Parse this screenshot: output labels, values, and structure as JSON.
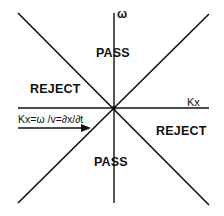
{
  "diagram": {
    "colors": {
      "line": "#111111",
      "background": "#ffffff"
    },
    "axes": {
      "vertical_label": "ω",
      "horizontal_label": "Kx"
    },
    "regions": {
      "top": "PASS",
      "bottom": "PASS",
      "left": "REJECT",
      "right": "REJECT"
    },
    "formula": "Kx=ω /v=∂x/∂t",
    "geometry": {
      "center": [
        114,
        108
      ],
      "diagonal_1": [
        [
          18,
          13
        ],
        [
          209,
          205
        ]
      ],
      "diagonal_2": [
        [
          209,
          14
        ],
        [
          18,
          203
        ]
      ],
      "vertical_axis": [
        [
          114,
          13
        ],
        [
          114,
          203
        ]
      ],
      "horizontal_axis": [
        [
          18,
          108
        ],
        [
          209,
          108
        ]
      ],
      "arrow": [
        [
          18,
          128
        ],
        [
          90,
          128
        ]
      ]
    }
  }
}
